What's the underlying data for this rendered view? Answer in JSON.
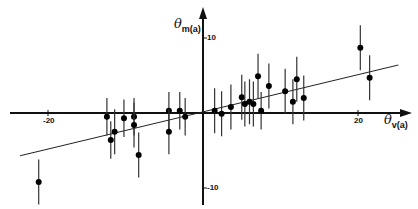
{
  "chart_data": {
    "type": "scatter",
    "title": "",
    "xlabel": "θv(a)",
    "ylabel": "θm(a)",
    "xlabel_main": "θ",
    "xlabel_sub": "v",
    "xlabel_suffix": "(a)",
    "ylabel_main": "θ",
    "ylabel_sub": "m",
    "ylabel_suffix": "(a)",
    "x_ticks": [
      {
        "value": -20,
        "label": "-20"
      },
      {
        "value": 20,
        "label": "20"
      }
    ],
    "y_ticks": [
      {
        "value": 10,
        "label": "10"
      },
      {
        "value": -10,
        "label": "-10"
      }
    ],
    "xlim": [
      -25,
      26
    ],
    "ylim": [
      -12.5,
      14
    ],
    "grid": false,
    "legend": "none",
    "axes_through_origin": true,
    "series": [
      {
        "name": "measurements",
        "marker": "filled-circle",
        "error_bars": "vertical",
        "points": [
          {
            "x": -21.2,
            "y": -9.2,
            "err": 3.0
          },
          {
            "x": -12.4,
            "y": -0.5,
            "err": 2.5
          },
          {
            "x": -11.9,
            "y": -3.6,
            "err": 2.5
          },
          {
            "x": -11.4,
            "y": -2.5,
            "err": 3.0
          },
          {
            "x": -10.2,
            "y": -0.7,
            "err": 2.5
          },
          {
            "x": -8.9,
            "y": -0.5,
            "err": 2.5
          },
          {
            "x": -8.9,
            "y": -1.6,
            "err": 3.0
          },
          {
            "x": -8.3,
            "y": -5.6,
            "err": 3.0
          },
          {
            "x": -4.4,
            "y": 0.3,
            "err": 2.5
          },
          {
            "x": -4.4,
            "y": -2.5,
            "err": 3.0
          },
          {
            "x": -3.0,
            "y": 0.3,
            "err": 2.5
          },
          {
            "x": -2.3,
            "y": -0.5,
            "err": 2.5
          },
          {
            "x": 1.5,
            "y": 0.3,
            "err": 3.0
          },
          {
            "x": 2.4,
            "y": -0.1,
            "err": 3.0
          },
          {
            "x": 3.6,
            "y": 0.8,
            "err": 3.0
          },
          {
            "x": 5.0,
            "y": 2.1,
            "err": 3.0
          },
          {
            "x": 5.4,
            "y": 1.2,
            "err": 3.0
          },
          {
            "x": 6.0,
            "y": 1.5,
            "err": 3.0
          },
          {
            "x": 6.5,
            "y": 1.2,
            "err": 3.0
          },
          {
            "x": 7.1,
            "y": 4.9,
            "err": 3.0
          },
          {
            "x": 7.5,
            "y": 0.3,
            "err": 2.5
          },
          {
            "x": 8.5,
            "y": 3.6,
            "err": 3.0
          },
          {
            "x": 10.6,
            "y": 2.9,
            "err": 3.0
          },
          {
            "x": 12.1,
            "y": 4.5,
            "err": 3.0
          },
          {
            "x": 11.6,
            "y": 1.5,
            "err": 3.0
          },
          {
            "x": 13.0,
            "y": 2.0,
            "err": 3.0
          },
          {
            "x": 20.3,
            "y": 8.7,
            "err": 3.0
          },
          {
            "x": 21.5,
            "y": 4.7,
            "err": 3.0
          }
        ]
      }
    ],
    "fit_line": {
      "x1": -23.6,
      "y1": -5.7,
      "x2": 25.2,
      "y2": 6.4
    }
  }
}
